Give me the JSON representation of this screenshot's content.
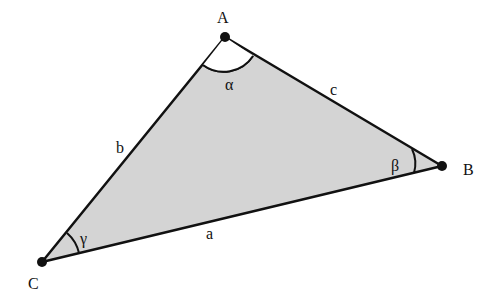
{
  "diagram": {
    "type": "triangle",
    "fill_color": "#d4d4d4",
    "stroke_color": "#111111",
    "vertices": {
      "A": {
        "label": "A",
        "x": 225,
        "y": 37
      },
      "B": {
        "label": "B",
        "x": 442,
        "y": 166
      },
      "C": {
        "label": "C",
        "x": 42,
        "y": 262
      }
    },
    "sides": {
      "a": {
        "label": "a",
        "between": "B-C"
      },
      "b": {
        "label": "b",
        "between": "A-C"
      },
      "c": {
        "label": "c",
        "between": "A-B"
      }
    },
    "angles": {
      "alpha": {
        "label": "α",
        "at": "A"
      },
      "beta": {
        "label": "β",
        "at": "B"
      },
      "gamma": {
        "label": "γ",
        "at": "C"
      }
    }
  }
}
